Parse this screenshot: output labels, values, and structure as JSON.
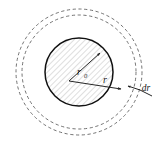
{
  "figure": {
    "width": 168,
    "height": 150,
    "background_color": "#ffffff"
  },
  "geometry": {
    "center_x": 79,
    "center_y": 72,
    "core_radius": 34,
    "inner_shell_radius": 57,
    "outer_shell_radius": 63
  },
  "colors": {
    "core_outline": "#111111",
    "hatch_line": "#b8b8b8",
    "dashed_circle": "#5a5a5a",
    "arrow": "#1a1a1a",
    "label": "#1a1a1a"
  },
  "labels": {
    "core_radius": {
      "base": "r",
      "subscript": "0",
      "x": 79,
      "y": 75
    },
    "shell_radius": {
      "base": "r",
      "subscript": "",
      "x": 105,
      "y": 83
    },
    "shell_thickness": {
      "base": "dr",
      "subscript": "",
      "x": 146,
      "y": 91
    }
  },
  "elements": {
    "core_name": "hatched-core-circle",
    "inner_dashed_name": "inner-dashed-circle",
    "outer_dashed_name": "outer-dashed-circle",
    "core_radius_arrow_name": "core-radius-arrow",
    "shell_radius_arrow_name": "shell-radius-arrow",
    "thickness_leader_name": "thickness-leader-line"
  }
}
